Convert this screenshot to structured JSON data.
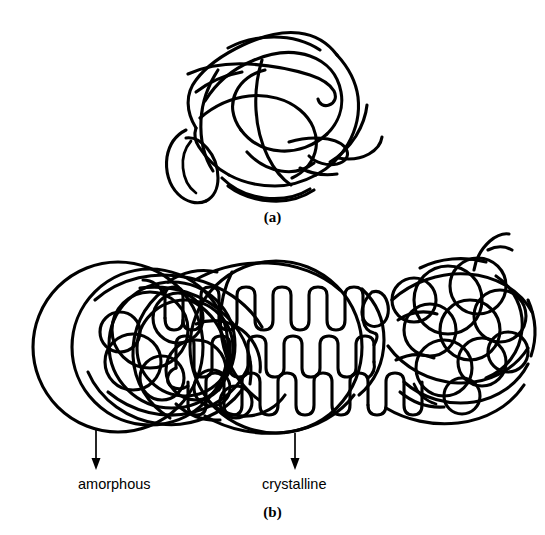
{
  "figure": {
    "background_color": "#ffffff",
    "stroke_color": "#000000",
    "width": 545,
    "height": 535,
    "panels": [
      {
        "id": "a",
        "caption": "(a)",
        "description": "randomly coiled amorphous polymer chain",
        "region": "top"
      },
      {
        "id": "b",
        "caption": "(b)",
        "description": "semicrystalline polymer with chain-folded lamellar crystallite between amorphous regions",
        "region": "bottom"
      }
    ]
  },
  "panel_a": {
    "caption": "(a)"
  },
  "panel_b": {
    "caption": "(b)",
    "annotations": [
      {
        "label": "amorphous",
        "arrow": "down",
        "target": "left-amorphous-coil-region"
      },
      {
        "label": "crystalline",
        "arrow": "down",
        "target": "central-lamellar-crystallite"
      }
    ],
    "labels": {
      "amorphous": "amorphous",
      "crystalline": "crystalline"
    }
  },
  "icons": {
    "arrow_down": "arrow-down-icon"
  }
}
